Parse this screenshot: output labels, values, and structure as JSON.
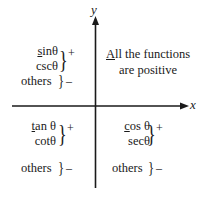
{
  "diagram": {
    "axes": {
      "x_label": "x",
      "y_label": "y"
    },
    "quadrant_I": {
      "line1_prefix": "A",
      "line1_rest": "ll the functions",
      "line2": "are positive"
    },
    "quadrant_II": {
      "fn1_prefix": "s",
      "fn1_rest": "inθ",
      "fn2": "cscθ",
      "positive_sign": "+",
      "others_label": "others",
      "negative_sign": "–"
    },
    "quadrant_III": {
      "fn1_prefix": "t",
      "fn1_rest": "an θ",
      "fn2": "cotθ",
      "positive_sign": "+",
      "others_label": "others",
      "negative_sign": "–"
    },
    "quadrant_IV": {
      "fn1_prefix": "c",
      "fn1_rest": "os θ",
      "fn2": "secθ",
      "positive_sign": "+",
      "others_label": "others",
      "negative_sign": "–"
    },
    "brace_glyph": "}",
    "colors": {
      "ink": "#1a1a1a",
      "background": "#ffffff"
    }
  }
}
